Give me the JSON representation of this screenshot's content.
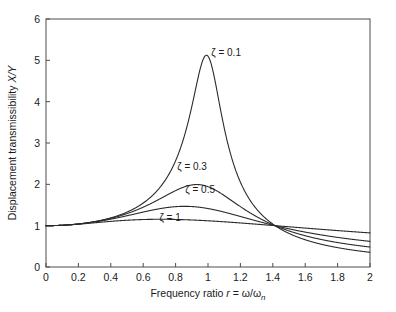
{
  "chart_data": {
    "type": "line",
    "title": "",
    "xlabel": "Frequency ratio r = ω/ωn",
    "ylabel": "Displacement transmissibility X/Y",
    "xlim": [
      0,
      2
    ],
    "ylim": [
      0,
      6
    ],
    "grid": false,
    "legend_position": "inline-annotations",
    "xticks": [
      "0",
      "0.2",
      "0.4",
      "0.6",
      "0.8",
      "1",
      "1.2",
      "1.4",
      "1.6",
      "1.8",
      "2"
    ],
    "xtick_values": [
      0,
      0.2,
      0.4,
      0.6,
      0.8,
      1,
      1.2,
      1.4,
      1.6,
      1.8,
      2
    ],
    "yticks": [
      "0",
      "1",
      "2",
      "3",
      "4",
      "5",
      "6"
    ],
    "ytick_values": [
      0,
      1,
      2,
      3,
      4,
      5,
      6
    ],
    "x": [
      0,
      0.1,
      0.2,
      0.3,
      0.4,
      0.5,
      0.6,
      0.7,
      0.8,
      0.9,
      0.95,
      1,
      1.05,
      1.1,
      1.2,
      1.3,
      1.414,
      1.5,
      1.6,
      1.7,
      1.8,
      1.9,
      2
    ],
    "series": [
      {
        "name": "ζ = 0.1",
        "zeta": 0.1,
        "color": "#2b2b2b",
        "label": "ζ = 0.1",
        "peak_x": 0.98,
        "peak_y": 5.12,
        "values": [
          1.0,
          1.01,
          1.042,
          1.102,
          1.195,
          1.337,
          1.565,
          1.971,
          2.834,
          4.702,
          5.098,
          5.025,
          4.093,
          3.102,
          1.927,
          1.383,
          1.0,
          0.858,
          0.73,
          0.635,
          0.561,
          0.502,
          0.454
        ]
      },
      {
        "name": "ζ = 0.3",
        "zeta": 0.3,
        "color": "#2b2b2b",
        "label": "ζ = 0.3",
        "peak_x": 0.92,
        "peak_y": 1.99,
        "values": [
          1.0,
          1.01,
          1.042,
          1.1,
          1.187,
          1.314,
          1.489,
          1.712,
          1.92,
          1.995,
          1.973,
          1.915,
          1.832,
          1.737,
          1.55,
          1.38,
          1.0,
          1.079,
          0.963,
          0.866,
          0.786,
          0.718,
          0.66
        ]
      },
      {
        "name": "ζ = 0.5",
        "zeta": 0.5,
        "color": "#2b2b2b",
        "label": "ζ = 0.5",
        "peak_x": 0.83,
        "peak_y": 1.47,
        "values": [
          1.0,
          1.009,
          1.038,
          1.084,
          1.147,
          1.222,
          1.3,
          1.371,
          1.428,
          1.462,
          1.47,
          1.472,
          1.468,
          1.459,
          1.424,
          1.377,
          1.0,
          1.256,
          1.19,
          1.125,
          1.063,
          1.006,
          0.953
        ]
      },
      {
        "name": "ζ = 1",
        "zeta": 1,
        "color": "#2b2b2b",
        "label": "ζ = 1",
        "peak_x": 0.78,
        "peak_y": 1.17,
        "values": [
          1.0,
          1.005,
          1.019,
          1.039,
          1.062,
          1.085,
          1.105,
          1.12,
          1.13,
          1.135,
          1.136,
          1.135,
          1.134,
          1.131,
          1.121,
          1.108,
          1.0,
          1.08,
          1.06,
          1.04,
          1.02,
          1.0,
          0.98
        ]
      }
    ],
    "annotations": [
      {
        "text": "ζ = 0.1",
        "x": 1.02,
        "y": 5.1
      },
      {
        "text": "ζ = 0.3",
        "x": 0.81,
        "y": 2.35
      },
      {
        "text": "ζ = 0.5",
        "x": 0.86,
        "y": 1.8
      },
      {
        "text": "ζ = 1",
        "x": 0.7,
        "y": 1.12
      }
    ]
  },
  "axes": {
    "x_title_prefix": "Frequency ratio ",
    "x_title_var": "r",
    "x_title_eq": " = ",
    "x_title_num": "ω",
    "x_title_slash": "/",
    "x_title_den": "ω",
    "x_title_sub": "n",
    "y_title_prefix": "Displacement transmissibility ",
    "y_title_var": "X/Y"
  }
}
